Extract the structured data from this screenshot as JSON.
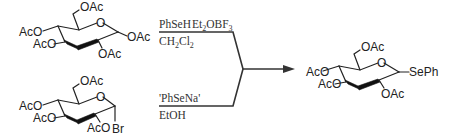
{
  "scheme": {
    "reactant_top": {
      "name": "penta-O-acetyl-beta-D-glucopyranose",
      "labels": {
        "c6": "OAc",
        "c4": "AcO",
        "c3": "AcO",
        "ring_o": "O",
        "c1": "OAc",
        "c2": "OAc"
      }
    },
    "reactant_bottom": {
      "name": "tetra-O-acetyl-alpha-D-glucopyranosyl bromide",
      "labels": {
        "c6": "OAc",
        "c4": "AcO",
        "c3": "AcO",
        "ring_o": "O",
        "c2": "AcO",
        "c1": "Br"
      }
    },
    "conditions_top": {
      "above_reagent1": "PhSeH",
      "above_reagent2_prefix": "Et",
      "above_reagent2_sub": "2",
      "above_reagent2_mid": "OBF",
      "above_reagent2_sub2": "3",
      "below_prefix": "CH",
      "below_sub1": "2",
      "below_mid": "Cl",
      "below_sub2": "2"
    },
    "conditions_bottom": {
      "above": "'PhSeNa'",
      "below": "EtOH"
    },
    "product": {
      "name": "phenyl 2,3,4,6-tetra-O-acetyl-1-seleno-beta-D-glucopyranoside",
      "labels": {
        "c6": "OAc",
        "c4": "AcO",
        "c3": "AcO",
        "ring_o": "O",
        "c1": "SePh",
        "c2": "OAc"
      }
    }
  }
}
